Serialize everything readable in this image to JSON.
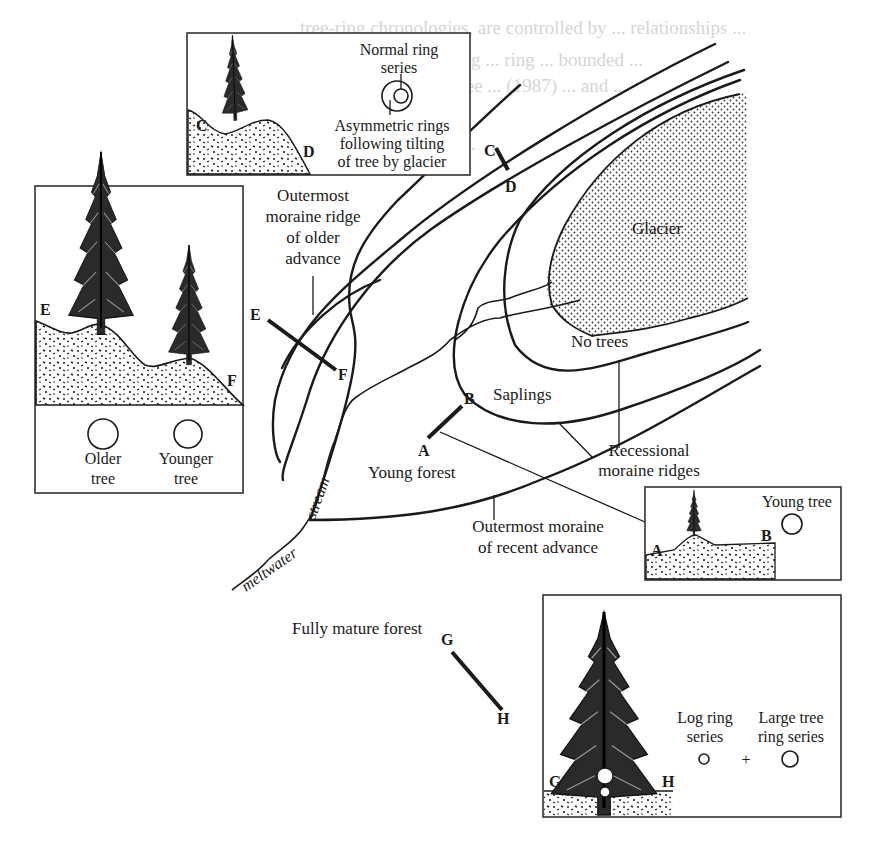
{
  "background_text": {
    "lines": [
      "tree-ring chronologies, are controlled by ... relationships ...",
      "ages produced ... dating ... ring ... bounded ...",
      "timberline ... young tree ... (1987) ... and ...",
      "... taken ... (1995) ...",
      "... and ... ... ... ... part ..."
    ]
  },
  "map": {
    "glacier_label": "Glacier",
    "no_trees_label": "No trees",
    "saplings_label": "Saplings",
    "young_forest_label": "Young forest",
    "fully_mature_forest_label": "Fully mature forest",
    "meltwater_label": "meltwater",
    "stream_label": "stream",
    "outermost_older": [
      "Outermost",
      "moraine ridge",
      "of older",
      "advance"
    ],
    "recessional": [
      "Recessional",
      "moraine ridges"
    ],
    "outermost_recent": [
      "Outermost moraine",
      "of recent advance"
    ],
    "transects": {
      "A": "A",
      "B": "B",
      "C": "C",
      "D": "D",
      "E": "E",
      "F": "F",
      "G": "G",
      "H": "H"
    }
  },
  "insets": {
    "cd": {
      "letter_left": "C",
      "letter_right": "D",
      "normal_label": [
        "Normal ring",
        "series"
      ],
      "asym_label": [
        "Asymmetric rings",
        "following tilting",
        "of tree by glacier"
      ]
    },
    "ef": {
      "letter_left": "E",
      "letter_right": "F",
      "older_label": [
        "Older",
        "tree"
      ],
      "younger_label": [
        "Younger",
        "tree"
      ]
    },
    "ab": {
      "letter_left": "A",
      "letter_right": "B",
      "young_tree_label": "Young tree"
    },
    "gh": {
      "letter_left": "G",
      "letter_right": "H",
      "log_label": [
        "Log ring",
        "series"
      ],
      "plus": "+",
      "large_label": [
        "Large tree",
        "ring series"
      ]
    }
  },
  "colors": {
    "ink": "#1a1a1a",
    "ghost_text": "#d6d6d6",
    "paper": "#ffffff"
  }
}
